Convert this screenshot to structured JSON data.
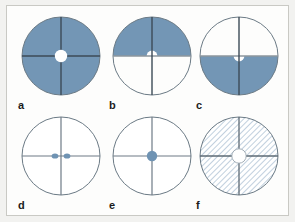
{
  "figure": {
    "background_color": "#f2f2f0",
    "plate_color": "#fdfdfc",
    "frame_border_color": "#c9c9c4",
    "fill_blue": "#7396b5",
    "hatch_blue": "#9fb7cc",
    "outline_color": "#6b7a85",
    "crosshair_color": "#3c4a57",
    "white": "#ffffff",
    "panels": [
      {
        "id": "a",
        "label": "a",
        "description": "fully-filled-disk-with-white-center-hole",
        "fill": "solid-blue",
        "filled_region": "whole-disk",
        "center_marker": "white-circle",
        "center_marker_radius": 6,
        "crosshair": true
      },
      {
        "id": "b",
        "label": "b",
        "description": "upper-half-filled-with-white-notch-at-center",
        "fill": "solid-blue",
        "filled_region": "upper-half",
        "center_marker": "white-notch-up",
        "center_marker_radius": 5,
        "crosshair": true
      },
      {
        "id": "c",
        "label": "c",
        "description": "lower-half-filled-with-white-notch-at-center",
        "fill": "solid-blue",
        "filled_region": "lower-half",
        "center_marker": "white-notch-down",
        "center_marker_radius": 5,
        "crosshair": true
      },
      {
        "id": "d",
        "label": "d",
        "description": "empty-disk-with-two-blue-dots-flanking-center",
        "fill": "none",
        "filled_region": "none",
        "center_marker": "two-blue-dots",
        "center_marker_radius": 3,
        "dot_offset": 6,
        "crosshair": true
      },
      {
        "id": "e",
        "label": "e",
        "description": "empty-disk-with-single-blue-dot-at-center",
        "fill": "none",
        "filled_region": "none",
        "center_marker": "blue-dot",
        "center_marker_radius": 5,
        "crosshair": true
      },
      {
        "id": "f",
        "label": "f",
        "description": "diagonally-hatched-disk-with-white-center-hole",
        "fill": "diagonal-hatch",
        "filled_region": "whole-disk",
        "center_marker": "white-circle",
        "center_marker_radius": 7,
        "crosshair": true
      }
    ]
  }
}
